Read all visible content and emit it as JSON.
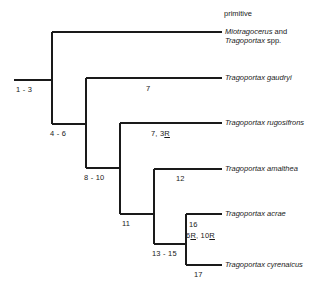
{
  "diagram": {
    "type": "cladogram",
    "title_note": "primitive",
    "line_color": "#1a1a1a",
    "background": "#ffffff",
    "taxa": [
      {
        "id": "miotragocerus",
        "line1": "Miotragocerus",
        "conjunction": " and",
        "line2": "Tragoportax",
        "line2_suffix": " spp."
      },
      {
        "id": "gaudryi",
        "name": "Tragoportax gaudryi"
      },
      {
        "id": "rugosifrons",
        "name": "Tragoportax rugosifrons"
      },
      {
        "id": "amalthea",
        "name": "Tragoportax amalthea"
      },
      {
        "id": "acrae",
        "name": "Tragoportax acrae"
      },
      {
        "id": "cyrenaicus",
        "name": "Tragoportax cyrenaicus"
      }
    ],
    "node_labels": [
      {
        "id": "root",
        "text": "1 - 3"
      },
      {
        "id": "node-4-6",
        "text": "4 - 6"
      },
      {
        "id": "node-8-10",
        "text": "8 - 10"
      },
      {
        "id": "node-11",
        "text": "11"
      },
      {
        "id": "node-13-15",
        "text": "13 - 15"
      }
    ],
    "branch_labels": [
      {
        "id": "branch-gaudryi",
        "text": "7"
      },
      {
        "id": "branch-rugosifrons",
        "prefix": "7, 3",
        "reversal": "R"
      },
      {
        "id": "branch-amalthea",
        "text": "12"
      },
      {
        "id": "branch-acrae-top",
        "text": "16"
      },
      {
        "id": "branch-acrae-rev",
        "part1": "6",
        "rev1": "R",
        "part2": ", 10",
        "rev2": "R"
      },
      {
        "id": "branch-cyrenaicus",
        "text": "17"
      }
    ]
  }
}
